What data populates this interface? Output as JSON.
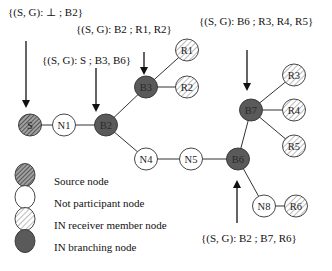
{
  "annotations": [
    {
      "id": "ann-s",
      "text": "{(S, G): ⊥ ; B2}",
      "x": 8,
      "y": 16
    },
    {
      "id": "ann-b3",
      "text": "{(S, G): B2 ; R1, R2}",
      "x": 76,
      "y": 33
    },
    {
      "id": "ann-b2",
      "text": "{(S, G): S ; B3, B6}",
      "x": 42,
      "y": 64
    },
    {
      "id": "ann-b7",
      "text": "{(S, G): B6 ; R3, R4, R5}",
      "x": 199,
      "y": 25
    },
    {
      "id": "ann-b6",
      "text": "{(S, G): B2 ; B7, R6}",
      "x": 201,
      "y": 242
    }
  ],
  "nodes": [
    {
      "id": "S",
      "label": "S",
      "type": "source",
      "x": 30,
      "y": 125
    },
    {
      "id": "N1",
      "label": "N1",
      "type": "not_participant",
      "x": 64,
      "y": 125
    },
    {
      "id": "B2",
      "label": "B2",
      "type": "branching",
      "x": 106,
      "y": 125
    },
    {
      "id": "B3",
      "label": "B3",
      "type": "branching",
      "x": 146,
      "y": 87
    },
    {
      "id": "R1",
      "label": "R1",
      "type": "receiver",
      "x": 187,
      "y": 50
    },
    {
      "id": "R2",
      "label": "R2",
      "type": "receiver",
      "x": 187,
      "y": 87
    },
    {
      "id": "N4",
      "label": "N4",
      "type": "not_participant",
      "x": 146,
      "y": 159
    },
    {
      "id": "N5",
      "label": "N5",
      "type": "not_participant",
      "x": 191,
      "y": 159
    },
    {
      "id": "B6",
      "label": "B6",
      "type": "branching",
      "x": 238,
      "y": 159
    },
    {
      "id": "B7",
      "label": "B7",
      "type": "branching",
      "x": 251,
      "y": 110
    },
    {
      "id": "R3",
      "label": "R3",
      "type": "receiver",
      "x": 294,
      "y": 75
    },
    {
      "id": "R4",
      "label": "R4",
      "type": "receiver",
      "x": 294,
      "y": 110
    },
    {
      "id": "R5",
      "label": "R5",
      "type": "receiver",
      "x": 294,
      "y": 146
    },
    {
      "id": "N8",
      "label": "N8",
      "type": "not_participant",
      "x": 264,
      "y": 206
    },
    {
      "id": "R6",
      "label": "R6",
      "type": "receiver",
      "x": 296,
      "y": 206
    }
  ],
  "edges": [
    [
      "S",
      "N1"
    ],
    [
      "N1",
      "B2"
    ],
    [
      "B2",
      "B3"
    ],
    [
      "B3",
      "R1"
    ],
    [
      "B3",
      "R2"
    ],
    [
      "B2",
      "N4"
    ],
    [
      "N4",
      "N5"
    ],
    [
      "N5",
      "B6"
    ],
    [
      "B6",
      "B7"
    ],
    [
      "B7",
      "R3"
    ],
    [
      "B7",
      "R4"
    ],
    [
      "B7",
      "R5"
    ],
    [
      "B6",
      "N8"
    ],
    [
      "N8",
      "R6"
    ]
  ],
  "legend": {
    "items": [
      {
        "type": "source",
        "label": "Source node"
      },
      {
        "type": "not_participant",
        "label": "Not participant node"
      },
      {
        "type": "receiver",
        "label": "IN receiver member node"
      },
      {
        "type": "branching",
        "label": "IN branching node"
      }
    ]
  },
  "colors": {
    "branching_fill": "#5a5a5a",
    "source_fill": "#9a9a9a",
    "source_hatch": "#4a4a4a",
    "receiver_fill": "#ffffff",
    "receiver_hatch": "#bcbcbc",
    "not_participant_fill": "#ffffff",
    "stroke": "#333333"
  }
}
